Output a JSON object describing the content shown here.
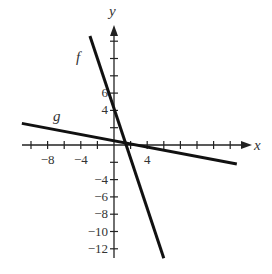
{
  "chart_data": {
    "type": "line",
    "title": "",
    "xlabel": "x",
    "ylabel": "y",
    "xlim": [
      -11,
      17
    ],
    "ylim": [
      -13,
      14
    ],
    "x_tick_step": 2,
    "y_tick_step": 2,
    "x_tick_labels": [
      "-8",
      "-4",
      "4"
    ],
    "y_tick_labels": [
      "6",
      "4",
      "-4",
      "-6",
      "-8",
      "-10",
      "-12"
    ],
    "grid": false,
    "series": [
      {
        "name": "f",
        "label": "f",
        "points": [
          [
            -2.9,
            12.6
          ],
          [
            6.0,
            -13.1
          ]
        ],
        "approx_equation": "f(x) = -3x + 4"
      },
      {
        "name": "g",
        "label": "g",
        "points": [
          [
            -11.1,
            2.5
          ],
          [
            14.8,
            -2.2
          ]
        ],
        "approx_equation": "g(x) = -0.2x + 0.5"
      }
    ],
    "axis_labels": {
      "x": "x",
      "y": "y"
    },
    "curve_labels": {
      "f": "f",
      "g": "g"
    }
  }
}
